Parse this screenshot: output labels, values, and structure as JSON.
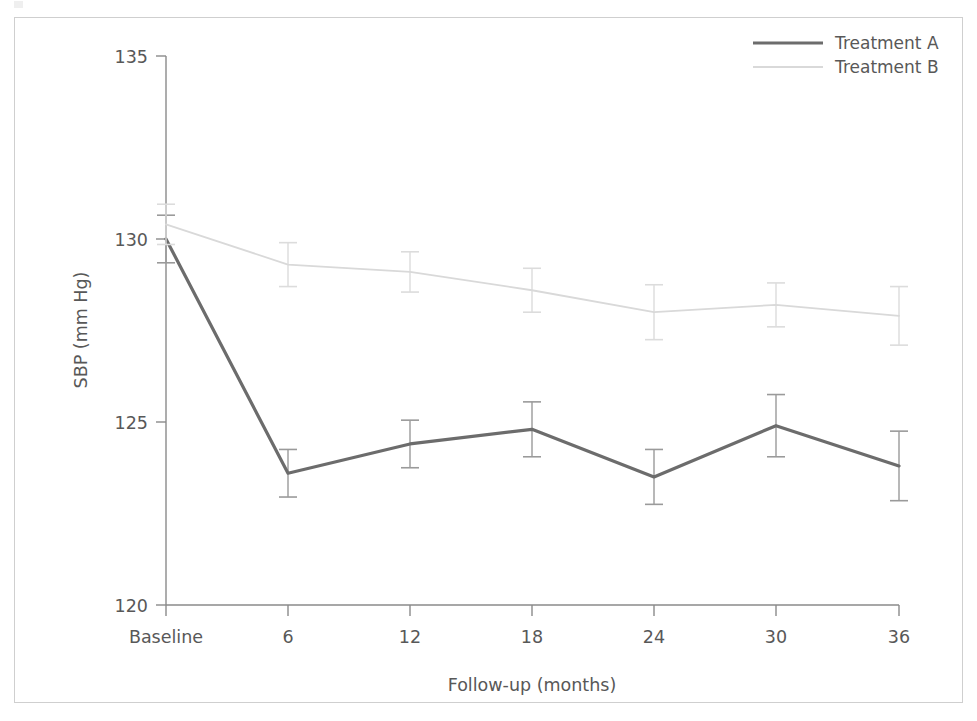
{
  "chart_data": {
    "type": "line",
    "title": "",
    "subtitle": "",
    "xlabel": "Follow-up (months)",
    "ylabel": "SBP (mm Hg)",
    "categories": [
      "Baseline",
      "6",
      "12",
      "18",
      "24",
      "30",
      "36"
    ],
    "x_tick_labels": [
      "Baseline",
      "6",
      "12",
      "18",
      "24",
      "30",
      "36"
    ],
    "y_tick_labels": [
      "120",
      "125",
      "130",
      "135"
    ],
    "y_ticks": [
      120,
      125,
      130,
      135
    ],
    "ylim": [
      120,
      135
    ],
    "grid": false,
    "legend_position": "top-right",
    "error_bars": true,
    "series": [
      {
        "name": "Treatment A",
        "color": "#6c6c6c",
        "line_width": 3.2,
        "values": [
          130.0,
          123.6,
          124.4,
          124.8,
          123.5,
          124.9,
          123.8
        ],
        "errors": [
          0.65,
          0.65,
          0.65,
          0.75,
          0.75,
          0.85,
          0.95
        ]
      },
      {
        "name": "Treatment B",
        "color": "#d9d9d9",
        "line_width": 1.8,
        "values": [
          130.4,
          129.3,
          129.1,
          128.6,
          128.0,
          128.2,
          127.9
        ],
        "errors": [
          0.55,
          0.6,
          0.55,
          0.6,
          0.75,
          0.6,
          0.8
        ]
      }
    ]
  },
  "legend": {
    "items": [
      {
        "label": "Treatment A"
      },
      {
        "label": "Treatment B"
      }
    ]
  },
  "axes": {
    "y_axis_title": "SBP (mm Hg)",
    "x_axis_title": "Follow-up (months)"
  },
  "colors": {
    "treatment_a": "#6c6c6c",
    "treatment_b": "#d9d9d9",
    "axis": "#8a8a8a",
    "text": "#585858",
    "frame": "#cfcfcf"
  }
}
